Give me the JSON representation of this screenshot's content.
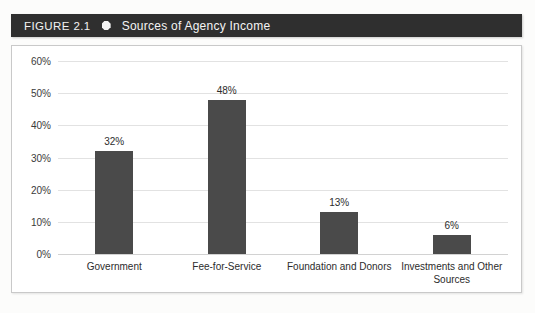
{
  "banner": {
    "figure_number": "FIGURE 2.1",
    "bullet_icon": "hexagon-bullet-icon",
    "title": "Sources of Agency Income",
    "background_color": "#2f2f2f",
    "text_color": "#f4f4f4"
  },
  "chart_data": {
    "type": "bar",
    "title": "Sources of Agency Income",
    "categories": [
      "Government",
      "Fee-for-Service",
      "Foundation and Donors",
      "Investments and Other Sources"
    ],
    "values": [
      32,
      48,
      13,
      6
    ],
    "value_labels": [
      "32%",
      "48%",
      "13%",
      "6%"
    ],
    "xlabel": "",
    "ylabel": "",
    "ylim": [
      0,
      60
    ],
    "ytick_values": [
      60,
      50,
      40,
      30,
      20,
      10,
      0
    ],
    "ytick_labels": [
      "60%",
      "50%",
      "40%",
      "30%",
      "20%",
      "10%",
      "0%"
    ],
    "grid": true,
    "legend": false,
    "bar_color": "#4a4a4a",
    "gridline_color": "#e2e2e2",
    "plot_background": "#ffffff"
  }
}
